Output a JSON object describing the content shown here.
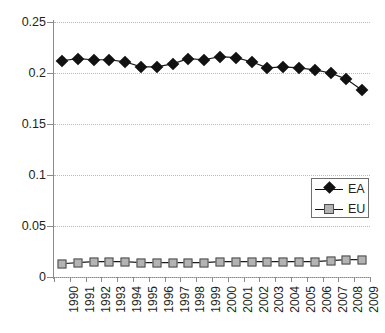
{
  "chart_data": {
    "type": "line",
    "title": "",
    "xlabel": "",
    "ylabel": "",
    "ylim": [
      0,
      0.25
    ],
    "yticks": [
      0,
      0.05,
      0.1,
      0.15,
      0.2,
      0.25
    ],
    "ytick_labels": [
      "0",
      "0.05",
      "0.1",
      "0.15",
      "0.2",
      "0.25"
    ],
    "grid": true,
    "legend_position": "center-right",
    "categories": [
      "1990",
      "1991",
      "1992",
      "1993",
      "1994",
      "1995",
      "1996",
      "1997",
      "1998",
      "1999",
      "2000",
      "2001",
      "2002",
      "2003",
      "2004",
      "2005",
      "2006",
      "2007",
      "2008",
      "2009"
    ],
    "series": [
      {
        "name": "EA",
        "marker": "diamond",
        "color": "#111111",
        "values": [
          0.212,
          0.214,
          0.213,
          0.213,
          0.211,
          0.206,
          0.206,
          0.209,
          0.214,
          0.213,
          0.216,
          0.215,
          0.211,
          0.205,
          0.206,
          0.205,
          0.203,
          0.2,
          0.194,
          0.183
        ]
      },
      {
        "name": "EU",
        "marker": "square",
        "color": "#b3b3b3",
        "values": [
          0.013,
          0.014,
          0.015,
          0.015,
          0.015,
          0.014,
          0.014,
          0.014,
          0.014,
          0.014,
          0.015,
          0.015,
          0.015,
          0.015,
          0.015,
          0.015,
          0.015,
          0.016,
          0.017,
          0.017
        ]
      }
    ]
  },
  "legend": {
    "entries": [
      {
        "label": "EA"
      },
      {
        "label": "EU"
      }
    ]
  }
}
